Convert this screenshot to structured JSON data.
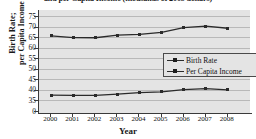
{
  "chart_data": {
    "type": "line",
    "title": "and per Capita Income (thousands of 2005 dollars)",
    "xlabel": "Year",
    "ylabel_line1": "Birth Rate;",
    "ylabel_line2": "per Capita Income",
    "categories": [
      "2000",
      "2001",
      "2002",
      "2003",
      "2004",
      "2005",
      "2006",
      "2007",
      "2008"
    ],
    "yticks": [
      "0",
      "35",
      "40",
      "45",
      "50",
      "55",
      "60",
      "65",
      "70",
      "75"
    ],
    "ylim": [
      35,
      75
    ],
    "axis_break": true,
    "grid": true,
    "legend_position": "center-right",
    "series": [
      {
        "name": "Birth Rate",
        "values": [
          37.5,
          37.4,
          37.4,
          38.0,
          38.7,
          39.1,
          40.1,
          40.6,
          40.0
        ],
        "color": "#2b2b2b"
      },
      {
        "name": "Per Capita Income",
        "values": [
          65.6,
          64.8,
          64.7,
          65.9,
          66.3,
          67.2,
          69.5,
          70.2,
          69.2
        ],
        "color": "#2b2b2b"
      }
    ],
    "plot_background": "#e4e4e4",
    "gridline_color": "#b9b9b9",
    "axis_color": "#3a3a3a"
  }
}
